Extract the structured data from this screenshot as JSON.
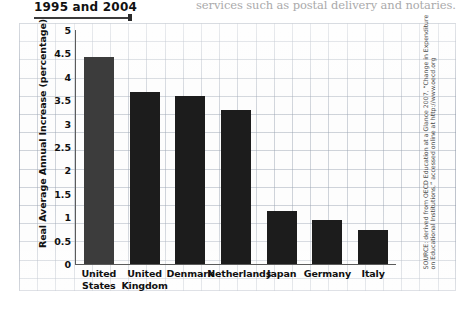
{
  "page": {
    "top_text_fragment": "services such as postal delivery and notaries. The",
    "caption_fragment": "1995 and 2004"
  },
  "source_note": "SOURCE: derived from OECD Education at a Glance 2007, “Change in Expenditure on Educational Institutions,” accessed online at http://www.oecd.org",
  "chart_data": {
    "type": "bar",
    "title": "1995 and 2004",
    "xlabel": "",
    "ylabel": "Real Average Annual Increase (percentage)",
    "categories": [
      "United States",
      "United Kingdom",
      "Denmark",
      "Netherlands",
      "Japan",
      "Germany",
      "Italy"
    ],
    "category_lines": [
      [
        "United",
        "States"
      ],
      [
        "United",
        "Kingdom"
      ],
      [
        "Denmark"
      ],
      [
        "Netherlands"
      ],
      [
        "Japan"
      ],
      [
        "Germany"
      ],
      [
        "Italy"
      ]
    ],
    "values": [
      4.43,
      3.68,
      3.6,
      3.3,
      1.13,
      0.95,
      0.72
    ],
    "ylim": [
      0,
      5
    ],
    "yticks": [
      0,
      0.5,
      1,
      1.5,
      2,
      2.5,
      3,
      3.5,
      4,
      4.5,
      5
    ],
    "ytick_labels": [
      "0",
      "0.5",
      "1",
      "1.5",
      "2",
      "2.5",
      "3",
      "3.5",
      "4",
      "4.5",
      "5"
    ],
    "grid": true,
    "legend": "none",
    "bar_color": "#1c1c1c",
    "highlight_index": 0,
    "highlight_color": "#3c3c3c"
  }
}
